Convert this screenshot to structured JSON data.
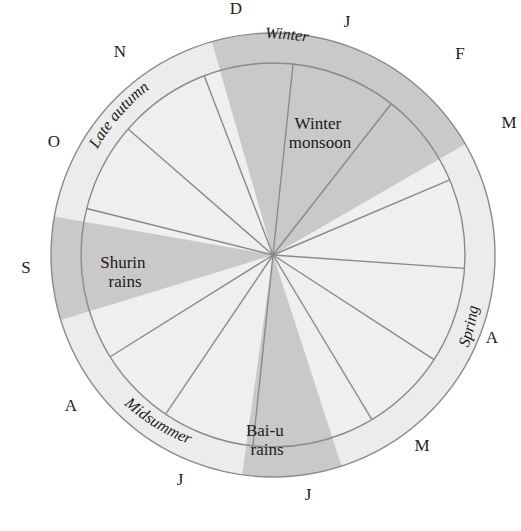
{
  "colors": {
    "background": "#ffffff",
    "ring_light": "#ececec",
    "inner_light": "#f2f2f2",
    "shade": "#c9c9c9",
    "line": "#8a8a8a"
  },
  "geometry": {
    "cx": 273,
    "cy": 255,
    "outer_r": 222,
    "inner_r": 192
  },
  "months": [
    {
      "label": "D",
      "x": 236,
      "y": 14
    },
    {
      "label": "J",
      "x": 347,
      "y": 27
    },
    {
      "label": "F",
      "x": 460,
      "y": 59
    },
    {
      "label": "M",
      "x": 509,
      "y": 128
    },
    {
      "label": "A",
      "x": 492,
      "y": 343
    },
    {
      "label": "M",
      "x": 422,
      "y": 451
    },
    {
      "label": "J",
      "x": 308,
      "y": 500
    },
    {
      "label": "J",
      "x": 180,
      "y": 485
    },
    {
      "label": "A",
      "x": 71,
      "y": 411
    },
    {
      "label": "S",
      "x": 26,
      "y": 273
    },
    {
      "label": "O",
      "x": 54,
      "y": 147
    },
    {
      "label": "N",
      "x": 120,
      "y": 57
    }
  ],
  "shaded_wedges": [
    {
      "name": "winter-monsoon",
      "start_deg": -106,
      "end_deg": -30
    },
    {
      "name": "shurin-rains",
      "start_deg": 190,
      "end_deg": 163
    },
    {
      "name": "bai-u-rains",
      "start_deg": 98,
      "end_deg": 72
    }
  ],
  "radial_lines_deg": [
    -84,
    -52,
    -23,
    4,
    33,
    59,
    96,
    124,
    148,
    194,
    221,
    249
  ],
  "wedge_labels": [
    {
      "lines": [
        "Winter",
        "monsoon"
      ],
      "x": 320,
      "y": 129
    },
    {
      "lines": [
        "Shurin",
        "rains"
      ],
      "x": 125,
      "y": 268
    },
    {
      "lines": [
        "Bai-u",
        "rains"
      ],
      "x": 267,
      "y": 436
    }
  ],
  "season_labels": [
    {
      "label": "Winter",
      "angle": -83,
      "offset": -1
    },
    {
      "label": "Late autumn",
      "angle": -145,
      "offset": 0
    },
    {
      "label": "Spring",
      "angle": 18,
      "offset": 0
    },
    {
      "label": "Midsummer",
      "angle": 127,
      "offset": 0
    }
  ]
}
